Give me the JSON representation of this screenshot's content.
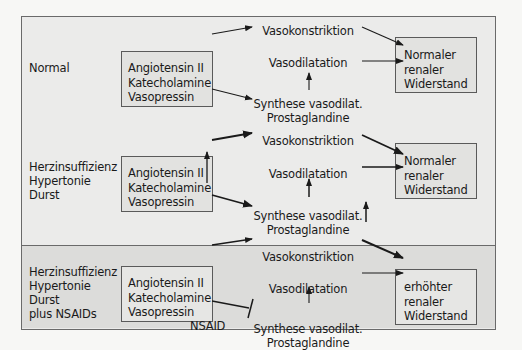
{
  "sections": [
    {
      "condition": [
        "Normal"
      ],
      "hormones": [
        "Angiotensin II",
        "Katecholamine",
        "Vasopressin"
      ],
      "hormones_increased": false,
      "vasoconstriction": "Vasokonstriktion",
      "vasodilatation": "Vasodilatation",
      "synthesis": [
        "Synthese vasodilat.",
        "Prostaglandine"
      ],
      "synthesis_increased": false,
      "result": [
        "Normaler",
        "renaler",
        "Widerstand"
      ]
    },
    {
      "condition": [
        "Herzinsuffizienz",
        "Hypertonie",
        "Durst"
      ],
      "hormones": [
        "Angiotensin II",
        "Katecholamine",
        "Vasopressin"
      ],
      "hormones_increased": true,
      "vasoconstriction": "Vasokonstriktion",
      "vasodilatation": "Vasodilatation",
      "synthesis": [
        "Synthese vasodilat.",
        "Prostaglandine"
      ],
      "synthesis_increased": true,
      "result": [
        "Normaler",
        "renaler",
        "Widerstand"
      ]
    },
    {
      "condition": [
        "Herzinsuffizienz",
        "Hypertonie",
        "Durst",
        "plus NSAIDs"
      ],
      "hormones": [
        "Angiotensin II",
        "Katecholamine",
        "Vasopressin"
      ],
      "hormones_increased": false,
      "vasoconstriction": "Vasokonstriktion",
      "vasodilatation": "Vasodilatation",
      "synthesis": [
        "Synthese vasodilat.",
        "Prostaglandine"
      ],
      "synthesis_increased": false,
      "inhibitor": "NSAID",
      "result": [
        "erhöhter",
        "renaler",
        "Widerstand"
      ]
    }
  ],
  "colors": {
    "stroke": "#1a1a1a",
    "frame": "#6a6a6a",
    "background": "#ebebea",
    "nsaid_background": "#dcdcda"
  }
}
